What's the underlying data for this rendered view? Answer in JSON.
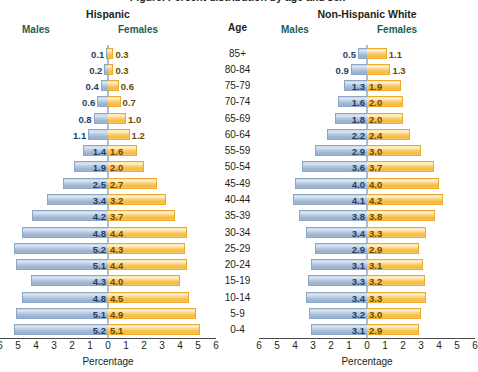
{
  "figure": {
    "cut_title": "Figure. Percent distribution by age and sex"
  },
  "age_column": {
    "title": "Age",
    "groups": [
      "85+",
      "80-84",
      "75-79",
      "70-74",
      "65-69",
      "60-64",
      "55-59",
      "50-54",
      "45-49",
      "40-44",
      "35-39",
      "30-34",
      "25-29",
      "20-24",
      "15-19",
      "10-14",
      "5-9",
      "0-4"
    ]
  },
  "axis": {
    "ticks": [
      "6",
      "5",
      "4",
      "3",
      "2",
      "1",
      "0",
      "1",
      "2",
      "3",
      "4",
      "5",
      "6"
    ],
    "label": "Percentage",
    "max": 6
  },
  "headers": {
    "males": "Males",
    "females": "Females"
  },
  "colors": {
    "male_bar": "#b3c6de",
    "female_bar": "#fcca6b",
    "male_text": "#1f3f6b",
    "female_text": "#6b4a06",
    "header_text": "#1a6054",
    "axis_line": "#5b7ba6"
  },
  "chart_data": [
    {
      "type": "bar",
      "title": "Hispanic",
      "subtype": "population-pyramid",
      "xlabel": "Percentage",
      "ylabel": "Age",
      "xlim": [
        0,
        6
      ],
      "grid": false,
      "categories": [
        "85+",
        "80-84",
        "75-79",
        "70-74",
        "65-69",
        "60-64",
        "55-59",
        "50-54",
        "45-49",
        "40-44",
        "35-39",
        "30-34",
        "25-29",
        "20-24",
        "15-19",
        "10-14",
        "5-9",
        "0-4"
      ],
      "series": [
        {
          "name": "Males",
          "values": [
            0.1,
            0.2,
            0.4,
            0.6,
            0.8,
            1.1,
            1.4,
            1.9,
            2.5,
            3.4,
            4.2,
            4.8,
            5.2,
            5.1,
            4.3,
            4.8,
            5.1,
            5.2
          ]
        },
        {
          "name": "Females",
          "values": [
            0.3,
            0.3,
            0.6,
            0.7,
            1.0,
            1.2,
            1.6,
            2.0,
            2.7,
            3.2,
            3.7,
            4.4,
            4.3,
            4.4,
            4.0,
            4.5,
            4.9,
            5.1
          ]
        }
      ]
    },
    {
      "type": "bar",
      "title": "Non-Hispanic White",
      "subtype": "population-pyramid",
      "xlabel": "Percentage",
      "ylabel": "Age",
      "xlim": [
        0,
        6
      ],
      "grid": false,
      "categories": [
        "85+",
        "80-84",
        "75-79",
        "70-74",
        "65-69",
        "60-64",
        "55-59",
        "50-54",
        "45-49",
        "40-44",
        "35-39",
        "30-34",
        "25-29",
        "20-24",
        "15-19",
        "10-14",
        "5-9",
        "0-4"
      ],
      "series": [
        {
          "name": "Males",
          "values": [
            0.5,
            0.9,
            1.3,
            1.6,
            1.8,
            2.2,
            2.9,
            3.6,
            4.0,
            4.1,
            3.8,
            3.4,
            2.9,
            3.1,
            3.3,
            3.4,
            3.2,
            3.1
          ]
        },
        {
          "name": "Females",
          "values": [
            1.1,
            1.3,
            1.9,
            2.0,
            2.0,
            2.4,
            3.0,
            3.7,
            4.0,
            4.2,
            3.8,
            3.3,
            2.9,
            3.1,
            3.2,
            3.3,
            3.0,
            2.9
          ]
        }
      ]
    }
  ]
}
